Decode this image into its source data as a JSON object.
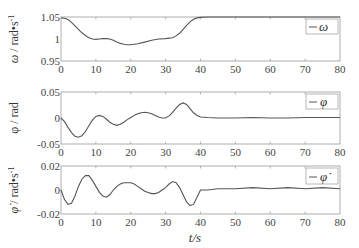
{
  "figure": {
    "xlabel": "t/s",
    "x_ticks": [
      "0",
      "10",
      "20",
      "30",
      "40",
      "50",
      "60",
      "70",
      "80"
    ]
  },
  "chart_data": [
    {
      "type": "line",
      "title": "",
      "xlabel": "",
      "ylabel": "ω / rad•s⁻¹",
      "legend": [
        "ω"
      ],
      "legend_position": "upper right",
      "xlim": [
        0,
        80
      ],
      "ylim": [
        0.95,
        1.05
      ],
      "x_ticks": [
        0,
        10,
        20,
        30,
        40,
        50,
        60,
        70,
        80
      ],
      "y_ticks": [
        "0.95",
        "1",
        "1.05"
      ],
      "y_tick_values": [
        0.95,
        1.0,
        1.05
      ],
      "grid": false,
      "series": [
        {
          "name": "ω",
          "color": "#555555",
          "x": [
            0,
            1,
            2,
            3,
            4,
            5,
            6,
            7,
            8,
            9,
            10,
            11,
            12,
            13,
            14,
            15,
            16,
            17,
            18,
            19,
            20,
            22,
            24,
            26,
            28,
            30,
            31,
            32,
            33,
            34,
            35,
            36,
            37,
            38,
            39,
            40,
            42,
            45,
            50,
            55,
            60,
            65,
            70,
            75,
            80
          ],
          "y": [
            1.048,
            1.047,
            1.044,
            1.038,
            1.03,
            1.022,
            1.014,
            1.008,
            1.003,
            1.0,
            0.999,
            1.0,
            1.001,
            1.001,
            1.0,
            0.997,
            0.993,
            0.99,
            0.988,
            0.987,
            0.987,
            0.989,
            0.993,
            0.997,
            1.0,
            1.001,
            1.002,
            1.003,
            1.007,
            1.013,
            1.022,
            1.031,
            1.039,
            1.045,
            1.048,
            1.049,
            1.05,
            1.05,
            1.05,
            1.05,
            1.05,
            1.05,
            1.05,
            1.05,
            1.05
          ]
        }
      ]
    },
    {
      "type": "line",
      "title": "",
      "xlabel": "",
      "ylabel": "φ / rad",
      "legend": [
        "φ"
      ],
      "legend_position": "upper right",
      "xlim": [
        0,
        80
      ],
      "ylim": [
        -0.05,
        0.05
      ],
      "x_ticks": [
        0,
        10,
        20,
        30,
        40,
        50,
        60,
        70,
        80
      ],
      "y_ticks": [
        "-0.05",
        "0",
        "0.05"
      ],
      "y_tick_values": [
        -0.05,
        0.0,
        0.05
      ],
      "grid": false,
      "series": [
        {
          "name": "φ",
          "color": "#555555",
          "x": [
            0,
            1,
            2,
            3,
            4,
            5,
            6,
            7,
            8,
            9,
            10,
            11,
            12,
            13,
            14,
            15,
            16,
            17,
            18,
            19,
            20,
            21,
            22,
            23,
            24,
            25,
            26,
            27,
            28,
            29,
            30,
            31,
            32,
            33,
            34,
            35,
            36,
            37,
            38,
            39,
            40,
            42,
            45,
            50,
            55,
            60,
            65,
            70,
            75,
            80
          ],
          "y": [
            0.0,
            -0.007,
            -0.018,
            -0.028,
            -0.035,
            -0.037,
            -0.034,
            -0.026,
            -0.015,
            -0.004,
            0.003,
            0.005,
            0.003,
            -0.002,
            -0.008,
            -0.012,
            -0.014,
            -0.012,
            -0.008,
            -0.003,
            0.001,
            0.005,
            0.008,
            0.01,
            0.011,
            0.01,
            0.008,
            0.005,
            0.002,
            0.0,
            0.0,
            0.004,
            0.011,
            0.019,
            0.026,
            0.029,
            0.026,
            0.018,
            0.01,
            0.005,
            0.002,
            0.001,
            0.0,
            0.0,
            0.001,
            0.0,
            0.0,
            0.001,
            0.001,
            0.001
          ]
        }
      ]
    },
    {
      "type": "line",
      "title": "",
      "xlabel": "t/s",
      "ylabel": "φ̇ / rad•s⁻¹",
      "legend": [
        "φ̇"
      ],
      "legend_position": "upper right",
      "xlim": [
        0,
        80
      ],
      "ylim": [
        -0.02,
        0.02
      ],
      "x_ticks": [
        0,
        10,
        20,
        30,
        40,
        50,
        60,
        70,
        80
      ],
      "y_ticks": [
        "-0.02",
        "0",
        "0.02"
      ],
      "y_tick_values": [
        -0.02,
        0.0,
        0.02
      ],
      "grid": false,
      "series": [
        {
          "name": "φ̇",
          "color": "#555555",
          "x": [
            0,
            1,
            2,
            3,
            4,
            5,
            6,
            7,
            8,
            9,
            10,
            11,
            12,
            13,
            14,
            15,
            16,
            17,
            18,
            19,
            20,
            21,
            22,
            23,
            24,
            25,
            26,
            27,
            28,
            29,
            30,
            31,
            32,
            33,
            34,
            35,
            36,
            37,
            38,
            39,
            40,
            42,
            45,
            50,
            55,
            60,
            65,
            70,
            75,
            80
          ],
          "y": [
            0.0,
            -0.008,
            -0.012,
            -0.011,
            -0.005,
            0.003,
            0.009,
            0.012,
            0.012,
            0.008,
            0.003,
            -0.002,
            -0.005,
            -0.006,
            -0.004,
            0.0,
            0.003,
            0.005,
            0.006,
            0.006,
            0.006,
            0.005,
            0.003,
            0.001,
            -0.001,
            -0.002,
            -0.003,
            -0.003,
            -0.002,
            0.0,
            0.002,
            0.005,
            0.007,
            0.006,
            0.002,
            -0.004,
            -0.01,
            -0.013,
            -0.012,
            -0.006,
            0.0,
            0.0,
            0.001,
            0.001,
            0.002,
            0.001,
            0.002,
            0.001,
            0.002,
            0.001
          ]
        }
      ]
    }
  ]
}
